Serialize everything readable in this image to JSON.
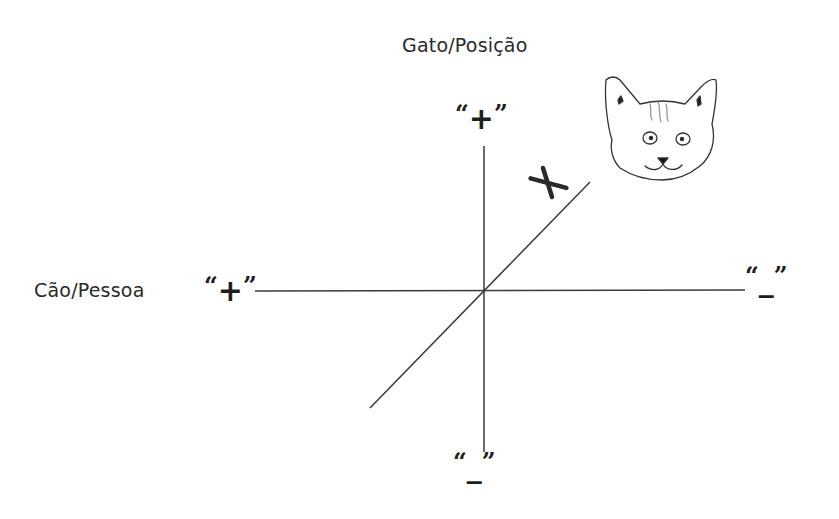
{
  "diagram": {
    "vertical_axis_title": "Gato/Posição",
    "horizontal_axis_title": "Cão/Pessoa",
    "top_sign": {
      "open_quote": "“",
      "symbol": "+",
      "close_quote": "”"
    },
    "bottom_sign": {
      "open_quote": "“",
      "symbol": "_",
      "close_quote": "”"
    },
    "left_sign": {
      "open_quote": "“",
      "symbol": "+",
      "close_quote": "”"
    },
    "right_sign": {
      "open_quote": "“",
      "symbol": "_",
      "close_quote": "”"
    },
    "diagonal_marker": "X",
    "illustration": "cat-face",
    "colors": {
      "background": "#ffffff",
      "line": "#3a3a3a",
      "text": "#2a2a2a"
    }
  }
}
